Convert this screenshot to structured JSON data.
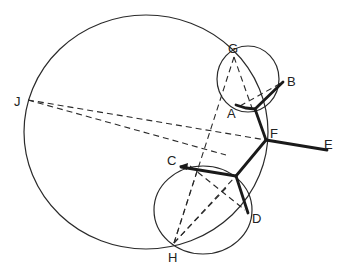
{
  "figure": {
    "type": "geometric diagram",
    "colors": {
      "line": "#2a2a2a",
      "thick": "#1a1a1a",
      "background": "#ffffff"
    },
    "circles": [
      {
        "name": "large-circle",
        "cx": 146,
        "cy": 132,
        "rx": 122,
        "ry": 117
      },
      {
        "name": "upper-small-circle",
        "cx": 248,
        "cy": 79,
        "rx": 31,
        "ry": 33
      },
      {
        "name": "lower-small-circle",
        "cx": 203,
        "cy": 210,
        "rx": 49,
        "ry": 44
      }
    ],
    "points": {
      "A": {
        "x": 236,
        "y": 105
      },
      "B": {
        "x": 283,
        "y": 82
      },
      "C": {
        "x": 180,
        "y": 166
      },
      "D": {
        "x": 248,
        "y": 213
      },
      "E": {
        "x": 327,
        "y": 150
      },
      "F": {
        "x": 266,
        "y": 140
      },
      "G": {
        "x": 234,
        "y": 57
      },
      "H": {
        "x": 174,
        "y": 243
      },
      "J": {
        "x": 28,
        "y": 100
      },
      "upper_junction": {
        "x": 255,
        "y": 109
      },
      "lower_junction": {
        "x": 236,
        "y": 176
      }
    },
    "labels": [
      {
        "id": "A",
        "text": "A",
        "x": 227,
        "y": 118
      },
      {
        "id": "B",
        "text": "B",
        "x": 287,
        "y": 86
      },
      {
        "id": "C",
        "text": "C",
        "x": 167,
        "y": 165
      },
      {
        "id": "D",
        "text": "D",
        "x": 252,
        "y": 223
      },
      {
        "id": "E",
        "text": "E",
        "x": 324,
        "y": 149
      },
      {
        "id": "F",
        "text": "F",
        "x": 270,
        "y": 138
      },
      {
        "id": "G",
        "text": "G",
        "x": 228,
        "y": 53
      },
      {
        "id": "H",
        "text": "H",
        "x": 168,
        "y": 262
      },
      {
        "id": "J",
        "text": "J",
        "x": 14,
        "y": 106
      }
    ],
    "thick_segments": [
      [
        "A",
        "upper_junction"
      ],
      [
        "upper_junction",
        "B"
      ],
      [
        "upper_junction",
        "F"
      ],
      [
        "F",
        "E"
      ],
      [
        "F",
        "lower_junction"
      ],
      [
        "lower_junction",
        "C"
      ],
      [
        "lower_junction",
        "D"
      ]
    ],
    "dashed_segments": [
      [
        "J",
        "F"
      ],
      [
        "J",
        "lower_junction_approach"
      ],
      [
        "G",
        "upper_junction"
      ],
      [
        "G",
        "H"
      ],
      [
        "A",
        "B"
      ],
      [
        "C",
        "D"
      ],
      [
        "H",
        "lower_junction"
      ],
      [
        "H",
        "D"
      ]
    ]
  }
}
